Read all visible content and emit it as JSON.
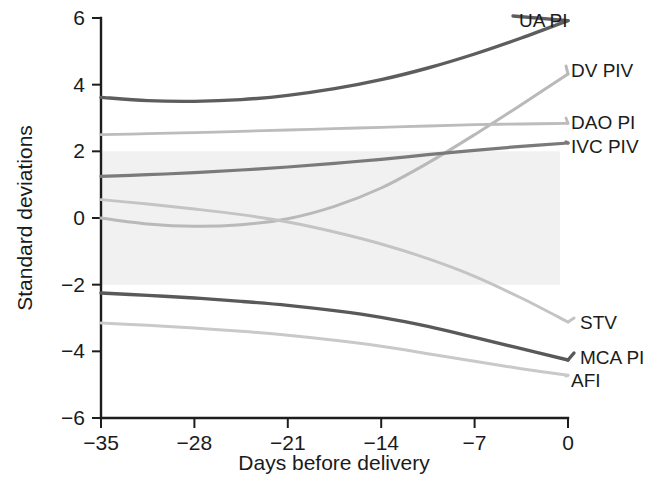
{
  "chart_data": {
    "type": "line",
    "title": "",
    "xlabel": "Days before delivery",
    "ylabel": "Standard deviations",
    "xlim": [
      -35,
      0
    ],
    "ylim": [
      -6,
      6
    ],
    "xticks": [
      "−35",
      "−28",
      "−21",
      "−14",
      "−7",
      "0"
    ],
    "xtick_values": [
      -35,
      -28,
      -21,
      -14,
      -7,
      0
    ],
    "yticks": [
      "6",
      "4",
      "2",
      "0",
      "−2",
      "−4",
      "−6"
    ],
    "ytick_values": [
      6,
      4,
      2,
      0,
      -2,
      -4,
      -6
    ],
    "grid": false,
    "legend_position": "right-inline-labels",
    "reference_band": {
      "label": "",
      "y_from": -2,
      "y_to": 2,
      "x_from": -35,
      "x_to": -0.6,
      "color": "#ececec"
    },
    "x": [
      -35,
      -31.5,
      -28,
      -24.5,
      -21,
      -17.5,
      -14,
      -10.5,
      -7,
      -3.5,
      0
    ],
    "series": [
      {
        "name": "UA PI",
        "color": "#5d5d5d",
        "width": 3.4,
        "values": [
          3.62,
          3.52,
          3.5,
          3.55,
          3.68,
          3.88,
          4.15,
          4.5,
          4.92,
          5.4,
          5.92
        ]
      },
      {
        "name": "DV PIV",
        "color": "#b9b9b9",
        "width": 3.0,
        "values": [
          0.0,
          -0.18,
          -0.25,
          -0.2,
          -0.02,
          0.35,
          0.9,
          1.65,
          2.5,
          3.4,
          4.32
        ]
      },
      {
        "name": "DAO PI",
        "color": "#bcbcbc",
        "width": 2.8,
        "values": [
          2.5,
          2.53,
          2.56,
          2.6,
          2.64,
          2.68,
          2.72,
          2.76,
          2.8,
          2.82,
          2.84
        ]
      },
      {
        "name": "IVC PIV",
        "color": "#7a7a7a",
        "width": 3.2,
        "values": [
          1.25,
          1.3,
          1.36,
          1.44,
          1.53,
          1.64,
          1.76,
          1.9,
          2.03,
          2.15,
          2.25
        ]
      },
      {
        "name": "STV",
        "color": "#c4c4c4",
        "width": 2.9,
        "values": [
          0.55,
          0.42,
          0.27,
          0.1,
          -0.12,
          -0.42,
          -0.78,
          -1.22,
          -1.75,
          -2.4,
          -3.12
        ]
      },
      {
        "name": "MCA PI",
        "color": "#595959",
        "width": 3.4,
        "values": [
          -2.25,
          -2.32,
          -2.4,
          -2.5,
          -2.62,
          -2.78,
          -2.98,
          -3.25,
          -3.58,
          -3.92,
          -4.26
        ]
      },
      {
        "name": "AFI",
        "color": "#c9c9c9",
        "width": 3.0,
        "values": [
          -3.15,
          -3.22,
          -3.3,
          -3.4,
          -3.52,
          -3.67,
          -3.85,
          -4.07,
          -4.3,
          -4.52,
          -4.72
        ]
      }
    ],
    "series_labels": [
      {
        "text": "UA PI",
        "x": 519,
        "y": 20
      },
      {
        "text": "DV PIV",
        "x": 571,
        "y": 70
      },
      {
        "text": "DAO PI",
        "x": 571,
        "y": 122
      },
      {
        "text": "IVC PIV",
        "x": 571,
        "y": 146
      },
      {
        "text": "STV",
        "x": 580,
        "y": 322
      },
      {
        "text": "MCA PI",
        "x": 580,
        "y": 357
      },
      {
        "text": "AFI",
        "x": 571,
        "y": 380
      }
    ]
  }
}
